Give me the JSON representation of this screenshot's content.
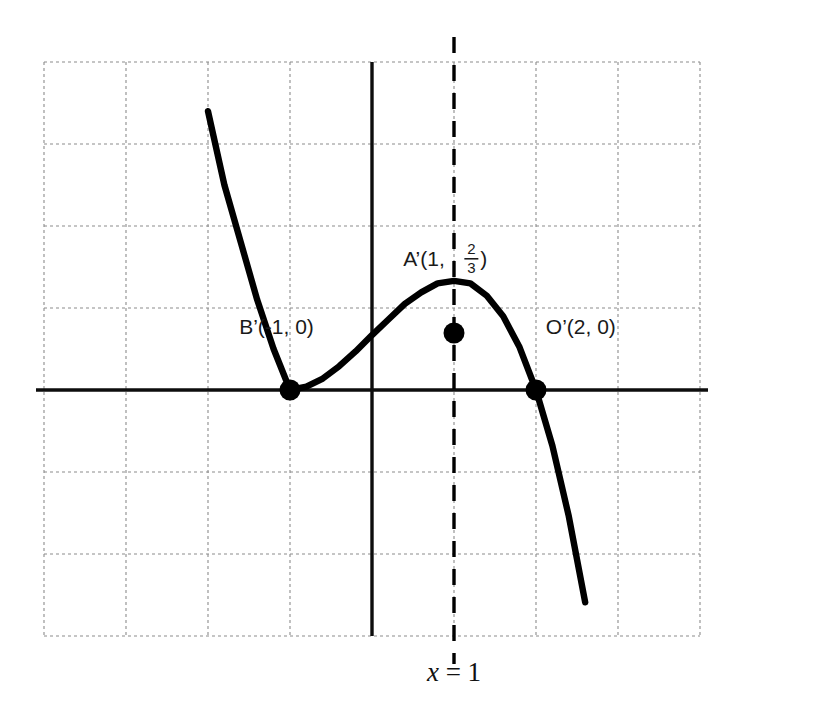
{
  "chart_data": {
    "type": "line",
    "title": "",
    "subtitle": "",
    "xlabel": "",
    "ylabel": "",
    "grid": true,
    "legend_position": "none",
    "xlim": [
      -4,
      4
    ],
    "ylim": [
      -3,
      4
    ],
    "x_gridline_values": [
      -4,
      -3,
      -2,
      -1,
      0,
      1,
      2,
      3,
      4
    ],
    "y_gridline_values": [
      -3,
      -2,
      -1,
      0,
      1,
      2,
      3,
      4
    ],
    "axes": {
      "x_axis_at_y": 0,
      "y_axis_at_x": 0,
      "x_axis_style": "solid",
      "y_axis_style": "solid"
    },
    "series": [
      {
        "name": "cubic-curve",
        "equation": "y = -(1/3)(x + 1)^2 (x - 2)",
        "style": "solid",
        "color": "#000000",
        "x_domain": [
          -2.0,
          3.0
        ],
        "points": [
          {
            "x": -2.0,
            "y": 3.4
          },
          {
            "x": -1.8,
            "y": 2.5
          },
          {
            "x": -1.6,
            "y": 1.8
          },
          {
            "x": -1.4,
            "y": 1.1
          },
          {
            "x": -1.2,
            "y": 0.5
          },
          {
            "x": -1.0,
            "y": 0.0
          },
          {
            "x": -0.8,
            "y": 0.04
          },
          {
            "x": -0.6,
            "y": 0.14
          },
          {
            "x": -0.4,
            "y": 0.29
          },
          {
            "x": -0.2,
            "y": 0.47
          },
          {
            "x": 0.0,
            "y": 0.67
          },
          {
            "x": 0.2,
            "y": 0.86
          },
          {
            "x": 0.4,
            "y": 1.05
          },
          {
            "x": 0.6,
            "y": 1.19
          },
          {
            "x": 0.8,
            "y": 1.3
          },
          {
            "x": 1.0,
            "y": 1.33
          },
          {
            "x": 1.2,
            "y": 1.3
          },
          {
            "x": 1.4,
            "y": 1.15
          },
          {
            "x": 1.6,
            "y": 0.9
          },
          {
            "x": 1.8,
            "y": 0.52
          },
          {
            "x": 2.0,
            "y": 0.0
          },
          {
            "x": 2.2,
            "y": -0.68
          },
          {
            "x": 2.4,
            "y": -1.54
          },
          {
            "x": 2.6,
            "y": -2.59
          },
          {
            "x": 2.8,
            "y": -3.85
          },
          {
            "x": 3.0,
            "y": -5.33
          }
        ]
      }
    ],
    "markers": [
      {
        "id": "B-prime",
        "label": "B’(-1, 0)",
        "x": -1,
        "y": 0,
        "label_dx": -0.62,
        "label_dy": 0.68
      },
      {
        "id": "A-prime",
        "label_prefix": "A’(1, ",
        "label_suffix": ")",
        "fraction_num": "2",
        "fraction_den": "3",
        "x": 1,
        "y": 0.695,
        "label_dx": -0.62,
        "label_dy": 0.82
      },
      {
        "id": "O-prime",
        "label": "O’(2, 0)",
        "x": 2,
        "y": 0,
        "label_dx": 0.12,
        "label_dy": 0.68
      }
    ],
    "vertical_lines": [
      {
        "id": "x-equals-1",
        "x": 1,
        "style": "dashed",
        "color": "#000000",
        "annotation": "x = 1"
      }
    ],
    "annotations": [
      {
        "id": "x-equals-1-label",
        "variable": "x",
        "relation": "=",
        "value": "1",
        "text": "x = 1",
        "x": 1,
        "y": -3.55
      }
    ]
  },
  "colors": {
    "curve": "#000000",
    "axis": "#0d0d0d",
    "grid": "#8c8c8c",
    "marker": "#000000",
    "text": "#1a1a1a",
    "background": "#ffffff"
  }
}
